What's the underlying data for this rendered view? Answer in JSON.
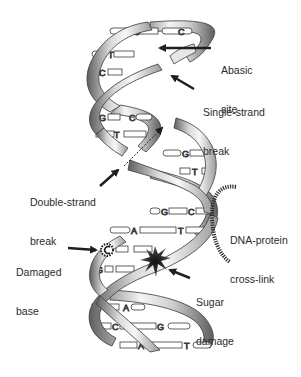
{
  "figure": {
    "title": "",
    "colors": {
      "background": "#ffffff",
      "ribbon_light": "#f2f2f2",
      "ribbon_mid": "#bdbdbd",
      "ribbon_dark": "#6f6f6f",
      "outline": "#3a3a3a",
      "text": "#2b2b2b",
      "arrow": "#1f1f1f"
    }
  },
  "labels": {
    "abasic_site": {
      "line1": "Abasic",
      "line2": "site"
    },
    "single_strand_break": {
      "line1": "Single-strand",
      "line2": "break"
    },
    "double_strand_break": {
      "line1": "Double-strand",
      "line2": "break"
    },
    "dna_protein_crosslink": {
      "line1": "DNA-protein",
      "line2": "cross-link"
    },
    "damaged_base": {
      "line1": "Damaged",
      "line2": "base"
    },
    "sugar_damage": {
      "line1": "Sugar",
      "line2": "damage"
    }
  },
  "base_pairs": [
    {
      "left": "G",
      "right": "C"
    },
    {
      "left": "T",
      "right": ""
    },
    {
      "left": "C",
      "right": ""
    },
    {
      "left": "G",
      "right": "C"
    },
    {
      "left": "T",
      "right": ""
    },
    {
      "left": "",
      "right": "G"
    },
    {
      "left": "",
      "right": "T"
    },
    {
      "left": "G",
      "right": "C"
    },
    {
      "left": "A",
      "right": "T"
    },
    {
      "left": "",
      "right": ""
    },
    {
      "left": "G",
      "right": ""
    },
    {
      "left": "T",
      "right": "A"
    },
    {
      "left": "C",
      "right": "G"
    },
    {
      "left": "A",
      "right": "T"
    }
  ]
}
